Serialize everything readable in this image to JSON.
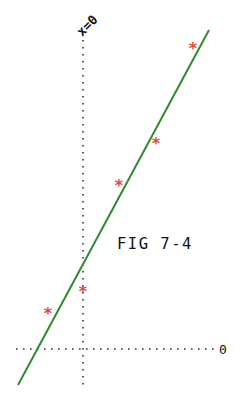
{
  "chart_data": {
    "type": "scatter",
    "title": "FIG 7-4",
    "xlabel": "",
    "ylabel": "",
    "axis_labels": {
      "vertical": "x=0",
      "horizontal": "0"
    },
    "grid": false,
    "series": [
      {
        "name": "data points",
        "marker": "*",
        "color": "#e8453c",
        "points": [
          {
            "x": -35,
            "y": 36
          },
          {
            "x": 0,
            "y": 58
          },
          {
            "x": 36,
            "y": 164
          },
          {
            "x": 73,
            "y": 206
          },
          {
            "x": 110,
            "y": 301
          }
        ]
      },
      {
        "name": "fit line",
        "type": "line",
        "color": "#2e8b2e",
        "points": [
          {
            "x": -65,
            "y": -36
          },
          {
            "x": 126,
            "y": 319
          }
        ]
      }
    ]
  },
  "labels": {
    "figure": "FIG 7-4",
    "vertical_axis": "x=0",
    "horizontal_axis": "0"
  },
  "colors": {
    "marker": "#e8453c",
    "line": "#2e8b2e",
    "axis": "#333333"
  }
}
